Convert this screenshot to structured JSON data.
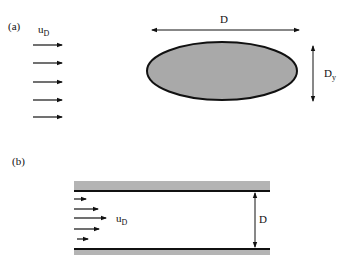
{
  "panel_a": {
    "label": "(a)",
    "velocity_label": "u",
    "velocity_subscript": "D",
    "arrow_count": 5,
    "width_label": "D",
    "height_label": "D",
    "height_subscript": "y",
    "ellipse_fill": "#a9a9a9",
    "ellipse_stroke": "#111111"
  },
  "panel_b": {
    "label": "(b)",
    "velocity_label": "u",
    "velocity_subscript": "D",
    "arrow_count": 5,
    "gap_label": "D",
    "wall_color": "#b4b4b4",
    "wall_line_color": "#111111"
  }
}
